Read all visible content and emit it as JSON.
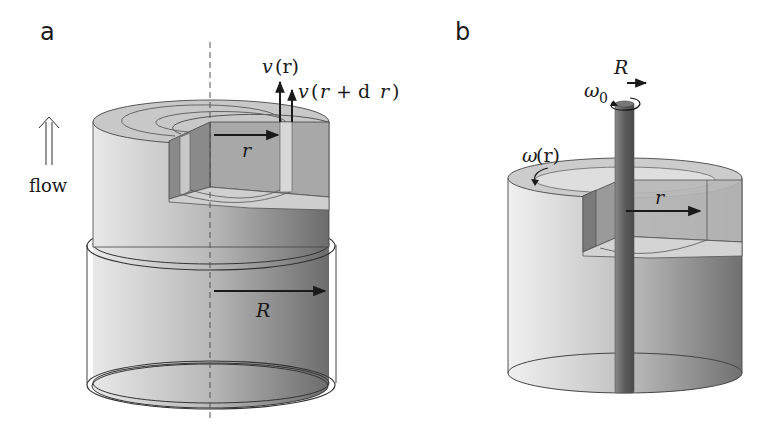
{
  "figure": {
    "panels": [
      {
        "id": "a",
        "label": "a",
        "description": "Pipe (cylinder) flow with cutaway showing coaxial shell between r and r + dr",
        "labels": {
          "velocity_r": "v(r)",
          "velocity_v": "v",
          "velocity_arg": "(r)",
          "velocity_rdr_v": "v",
          "velocity_rdr_open": "(",
          "velocity_rdr_r": "r",
          "velocity_rdr_plus": "+ d",
          "velocity_rdr_r2": "r",
          "velocity_rdr_close": ")",
          "radius_inner": "r",
          "radius_outer": "R",
          "flow": "flow"
        },
        "icons": [
          "double-up-arrow-icon"
        ]
      },
      {
        "id": "b",
        "label": "b",
        "description": "Rotating rod (radius R, angular velocity ω0) inside a cylinder of fluid; cutaway shows shell at radius r rotating with ω(r)",
        "labels": {
          "rod_radius": "R",
          "rod_omega": "ω",
          "rod_omega_sub": "0",
          "fluid_omega": "ω",
          "fluid_omega_arg": "(r)",
          "radius": "r"
        },
        "icons": [
          "rotation-arrow-icon"
        ]
      }
    ],
    "colors": {
      "background": "#ffffff",
      "ink": "#1a1a1a",
      "light_gray": "#e6e6e6",
      "mid_gray": "#b4b4b4",
      "dark_gray": "#6e6e6e",
      "rod": "#6a6a6a"
    }
  }
}
